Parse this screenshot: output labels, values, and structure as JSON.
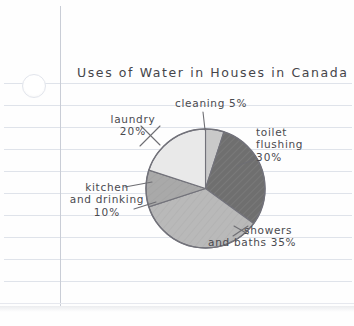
{
  "page": {
    "medium": "lined-notebook-paper",
    "paper_color": "#fefefe",
    "rule_color": "#dfe3ea",
    "margin_line_color": "#c9cdd6",
    "ink_color": "#4a4a4f"
  },
  "chart_data": {
    "type": "pie",
    "title": "Uses of Water in Houses in Canada",
    "xlabel": "",
    "ylabel": "",
    "legend_position": "none",
    "grid": false,
    "start_angle_deg": 0,
    "direction": "clockwise",
    "categories": [
      "cleaning",
      "toilet flushing",
      "showers and baths",
      "kitchen and drinking",
      "laundry"
    ],
    "values": [
      5,
      30,
      35,
      10,
      20
    ],
    "units": "percent",
    "total": 100,
    "colors": [
      "#c9c9c9",
      "#6f6f6f",
      "#b9b9b9",
      "#a9a9a9",
      "#e9e9e9"
    ],
    "slices": [
      {
        "label": "cleaning",
        "value": 5,
        "value_text": "5%",
        "color": "#c9c9c9"
      },
      {
        "label": "toilet flushing",
        "value": 30,
        "value_text": "30%",
        "color": "#6f6f6f"
      },
      {
        "label": "showers and baths",
        "value": 35,
        "value_text": "35%",
        "color": "#b9b9b9"
      },
      {
        "label": "kitchen and drinking",
        "value": 10,
        "value_text": "10%",
        "color": "#a9a9a9"
      },
      {
        "label": "laundry",
        "value": 20,
        "value_text": "20%",
        "color": "#e9e9e9"
      }
    ]
  },
  "labels": {
    "cleaning": {
      "line1": "cleaning 5%"
    },
    "laundry": {
      "line1": "laundry",
      "line2": "20%"
    },
    "toilet": {
      "line1": "toilet",
      "line2": "flushing",
      "line3": "30%"
    },
    "kitchen": {
      "line1": "kitchen",
      "line2": "and drinking",
      "line3": "10%"
    },
    "showers": {
      "line1": "showers",
      "line2": "and baths 35%"
    }
  }
}
